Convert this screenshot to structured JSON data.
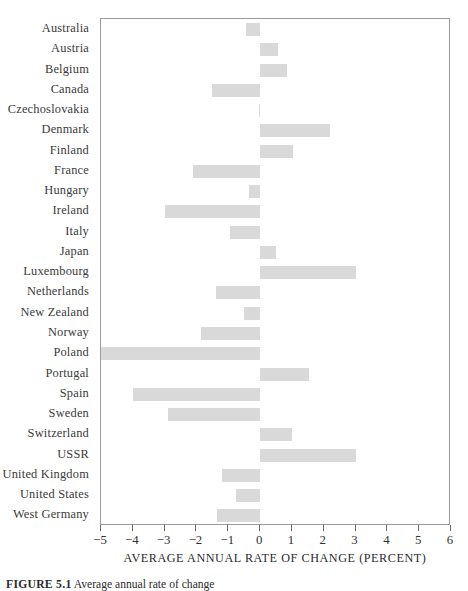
{
  "figure": {
    "caption_label": "FIGURE 5.1",
    "caption_text": "Average annual rate of change"
  },
  "chart_data": {
    "type": "bar",
    "orientation": "horizontal",
    "title": "",
    "xlabel": "AVERAGE ANNUAL RATE OF CHANGE (PERCENT)",
    "ylabel": "",
    "xlim": [
      -5,
      6
    ],
    "xticks": [
      -5,
      -4,
      -3,
      -2,
      -1,
      0,
      1,
      2,
      3,
      4,
      5,
      6
    ],
    "xticklabels": [
      "-5",
      "-4",
      "-3",
      "-2",
      "-1",
      "0",
      "1",
      "2",
      "3",
      "4",
      "5",
      "6"
    ],
    "grid": false,
    "legend": null,
    "bar_color": "#d9d9d9",
    "categories": [
      "Australia",
      "Austria",
      "Belgium",
      "Canada",
      "Czechoslovakia",
      "Denmark",
      "Finland",
      "France",
      "Hungary",
      "Ireland",
      "Italy",
      "Japan",
      "Luxembourg",
      "Netherlands",
      "New Zealand",
      "Norway",
      "Poland",
      "Portugal",
      "Spain",
      "Sweden",
      "Switzerland",
      "USSR",
      "United Kingdom",
      "United States",
      "West Germany"
    ],
    "values": [
      -0.45,
      0.55,
      0.85,
      -1.5,
      -0.05,
      2.2,
      1.05,
      -2.1,
      -0.35,
      -3.0,
      -0.95,
      0.5,
      3.0,
      -1.4,
      -0.5,
      -1.85,
      -5.0,
      1.55,
      -4.0,
      -2.9,
      1.0,
      3.0,
      -1.2,
      -0.75,
      -1.35
    ]
  }
}
